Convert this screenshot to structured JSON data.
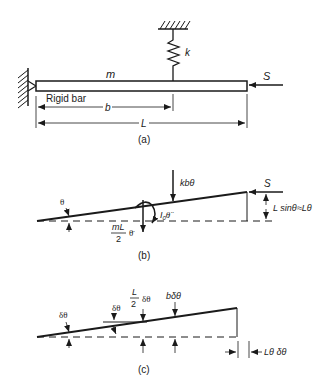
{
  "figure": {
    "background": "#ffffff",
    "ink": "#1a1a1a",
    "panels": [
      {
        "id": "a",
        "caption": "(a)"
      },
      {
        "id": "b",
        "caption": "(b)"
      },
      {
        "id": "c",
        "caption": "(c)"
      }
    ]
  },
  "panel_a": {
    "caption": "(a)",
    "mass_label": "m",
    "spring_label": "k",
    "force_label": "S",
    "bar_label": "Rigid bar",
    "dim_b": "b",
    "dim_L": "L"
  },
  "panel_b": {
    "caption": "(b)",
    "angle_label": "θ",
    "spring_force": "kbθ",
    "force_label": "S",
    "inertia_moment_base": "I",
    "inertia_moment_sub": "0",
    "inertia_moment_var": "θ̈",
    "mass_force_num": "mL",
    "mass_force_den": "2",
    "mass_force_var": "θ̈",
    "height_label": "L sinθ≈Lθ"
  },
  "panel_c": {
    "caption": "(c)",
    "angle_left": "δθ",
    "angle_mid": "δθ",
    "disp_mid_num": "L",
    "disp_mid_den": "2",
    "disp_mid_var": "δθ",
    "disp_spring": "bδθ",
    "horiz_disp": "Lθ δθ"
  }
}
